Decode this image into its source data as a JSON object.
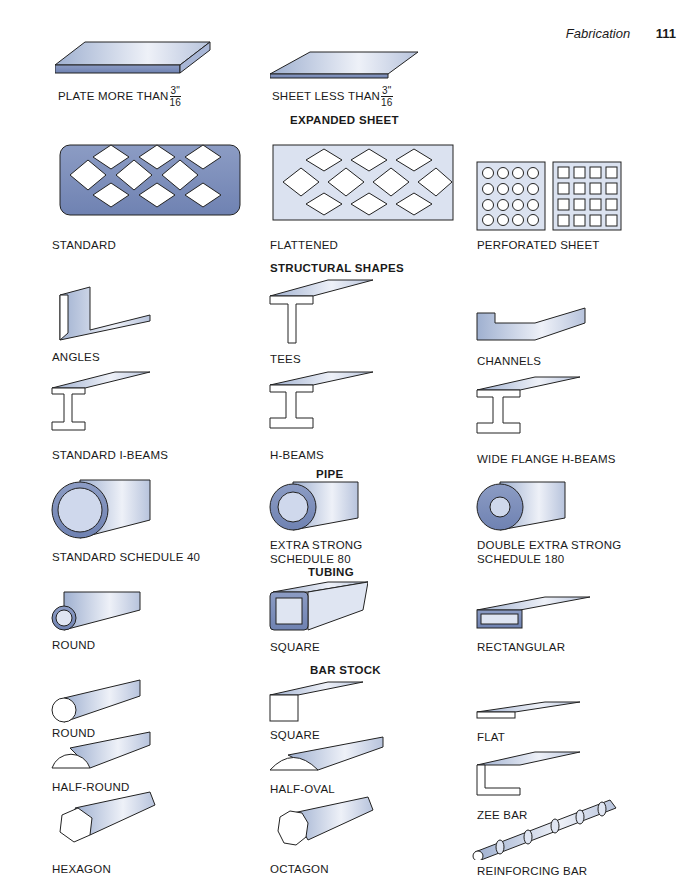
{
  "header": {
    "section": "Fabrication",
    "page": "111"
  },
  "sections": {
    "expanded": "EXPANDED SHEET",
    "structural": "STRUCTURAL SHAPES",
    "pipe": "PIPE",
    "tubing": "TUBING",
    "bar": "BAR STOCK"
  },
  "labels": {
    "plate": "PLATE MORE THAN",
    "sheet": "SHEET LESS THAN",
    "frac_num": "3\"",
    "frac_den": "16",
    "standard": "STANDARD",
    "flattened": "FLATTENED",
    "perforated": "PERFORATED SHEET",
    "angles": "ANGLES",
    "tees": "TEES",
    "channels": "CHANNELS",
    "ibeams": "STANDARD I-BEAMS",
    "hbeams": "H-BEAMS",
    "wideflange": "WIDE FLANGE H-BEAMS",
    "sched40": "STANDARD SCHEDULE 40",
    "sched80_1": "EXTRA STRONG",
    "sched80_2": "SCHEDULE 80",
    "sched180_1": "DOUBLE EXTRA STRONG",
    "sched180_2": "SCHEDULE 180",
    "tube_round": "ROUND",
    "tube_square": "SQUARE",
    "tube_rect": "RECTANGULAR",
    "bar_round": "ROUND",
    "bar_square": "SQUARE",
    "bar_flat": "FLAT",
    "halfround": "HALF-ROUND",
    "halfoval": "HALF-OVAL",
    "zee": "ZEE BAR",
    "hexagon": "HEXAGON",
    "octagon": "OCTAGON",
    "rebar": "REINFORCING BAR"
  }
}
